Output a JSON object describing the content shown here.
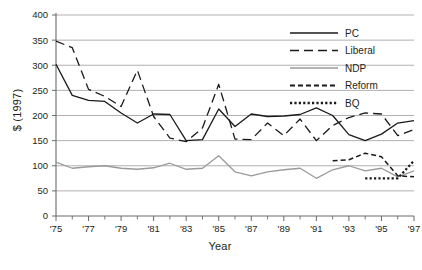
{
  "chart_data": {
    "type": "line",
    "title": "",
    "xlabel": "Year",
    "ylabel": "$ (1997)",
    "xlim": [
      1975,
      1997
    ],
    "ylim": [
      0,
      400
    ],
    "yticks": [
      0,
      50,
      100,
      150,
      200,
      250,
      300,
      350,
      400
    ],
    "ytick_labels": [
      "0",
      "50",
      "100",
      "150",
      "200",
      "250",
      "300",
      "350",
      "400"
    ],
    "xticks": [
      1975,
      1977,
      1979,
      1981,
      1983,
      1985,
      1987,
      1989,
      1991,
      1993,
      1995,
      1997
    ],
    "xtick_labels": [
      "'75",
      "'77",
      "'79",
      "'81",
      "'83",
      "'85",
      "'87",
      "'89",
      "'91",
      "'93",
      "'95",
      "'97"
    ],
    "xticks_minor": [
      1976,
      1978,
      1980,
      1982,
      1984,
      1986,
      1988,
      1990,
      1992,
      1994,
      1996
    ],
    "grid": "horizontal",
    "legend_position": "top-right",
    "series": [
      {
        "name": "PC",
        "style": "solid",
        "color": "#1a1a1a",
        "x": [
          1975,
          1976,
          1977,
          1978,
          1979,
          1980,
          1981,
          1982,
          1983,
          1984,
          1985,
          1986,
          1987,
          1988,
          1989,
          1990,
          1991,
          1992,
          1993,
          1994,
          1995,
          1996,
          1997
        ],
        "values": [
          302,
          240,
          230,
          228,
          205,
          185,
          203,
          202,
          150,
          152,
          213,
          178,
          203,
          198,
          199,
          202,
          215,
          200,
          162,
          150,
          163,
          185,
          190
        ]
      },
      {
        "name": "Liberal",
        "style": "dashed",
        "color": "#1a1a1a",
        "x": [
          1975,
          1976,
          1977,
          1978,
          1979,
          1980,
          1981,
          1982,
          1983,
          1984,
          1985,
          1986,
          1987,
          1988,
          1989,
          1990,
          1991,
          1992,
          1993,
          1994,
          1995,
          1996,
          1997
        ],
        "values": [
          348,
          335,
          252,
          238,
          218,
          290,
          198,
          155,
          148,
          175,
          262,
          153,
          152,
          185,
          160,
          193,
          150,
          180,
          196,
          205,
          203,
          160,
          172
        ]
      },
      {
        "name": "NDP",
        "style": "solid",
        "color": "#9a9a9a",
        "x": [
          1975,
          1976,
          1977,
          1978,
          1979,
          1980,
          1981,
          1982,
          1983,
          1984,
          1985,
          1986,
          1987,
          1988,
          1989,
          1990,
          1991,
          1992,
          1993,
          1994,
          1995,
          1996,
          1997
        ],
        "values": [
          107,
          95,
          98,
          100,
          95,
          93,
          96,
          105,
          93,
          95,
          120,
          88,
          80,
          88,
          92,
          95,
          75,
          92,
          100,
          90,
          95,
          78,
          90
        ]
      },
      {
        "name": "Reform",
        "style": "fine-dashed",
        "color": "#1a1a1a",
        "x": [
          1992,
          1993,
          1994,
          1995,
          1996,
          1997
        ],
        "values": [
          110,
          112,
          125,
          118,
          80,
          78
        ]
      },
      {
        "name": "BQ",
        "style": "dotted",
        "color": "#1a1a1a",
        "x": [
          1994,
          1995,
          1996,
          1997
        ],
        "values": [
          75,
          75,
          75,
          110
        ]
      }
    ],
    "legend": [
      {
        "label": "PC",
        "style": "solid",
        "color": "#1a1a1a"
      },
      {
        "label": "Liberal",
        "style": "dashed",
        "color": "#1a1a1a"
      },
      {
        "label": "NDP",
        "style": "solid",
        "color": "#9a9a9a"
      },
      {
        "label": "Reform",
        "style": "fine-dashed",
        "color": "#1a1a1a"
      },
      {
        "label": "BQ",
        "style": "dotted",
        "color": "#1a1a1a"
      }
    ]
  },
  "axes": {
    "y_title": "$ (1997)",
    "x_title": "Year"
  },
  "colors": {
    "grid": "#a8a8a8",
    "axis": "#6b6b6b",
    "text": "#231f20",
    "pc": "#1a1a1a",
    "liberal": "#1a1a1a",
    "ndp": "#9a9a9a",
    "reform": "#1a1a1a",
    "bq": "#1a1a1a"
  }
}
